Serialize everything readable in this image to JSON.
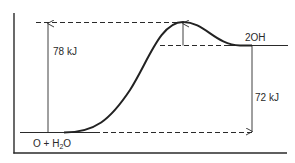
{
  "diagram": {
    "type": "reaction-energy-profile",
    "labels": {
      "activation_energy": "78 kJ",
      "reaction_energy": "72 kJ",
      "products": "2OH",
      "reactants_prefix": "O + H",
      "reactants_sub": "2",
      "reactants_suffix": "O"
    },
    "levels": {
      "reactants": "O + H2O",
      "products": "2OH",
      "activation_energy_kJ": 78,
      "reaction_energy_kJ": 72
    },
    "colors": {
      "line": "#2a2a2a",
      "curve": "#222222",
      "background": "#ffffff"
    }
  }
}
